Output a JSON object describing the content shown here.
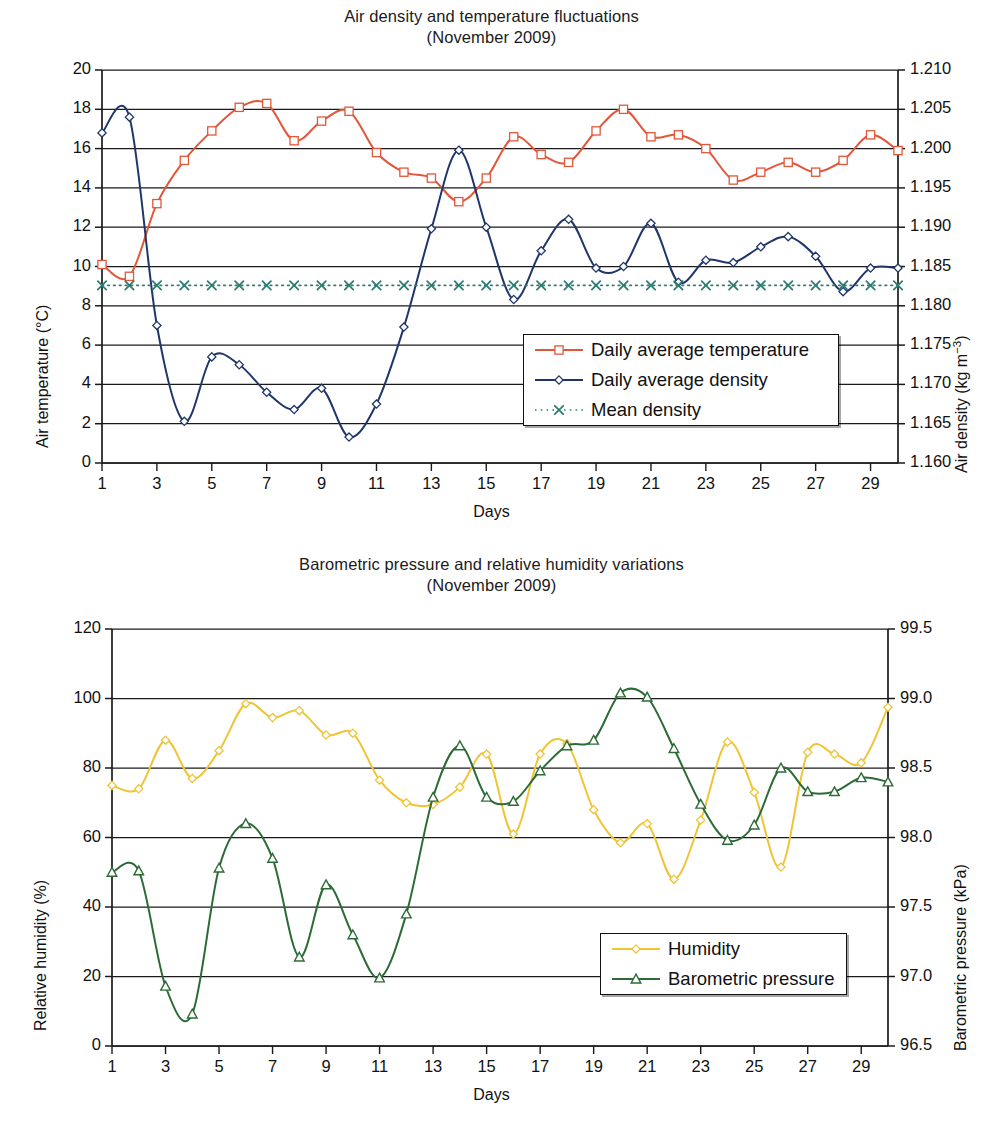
{
  "chart_data": [
    {
      "type": "line",
      "title": "Air density and temperature fluctuations",
      "subtitle": "(November 2009)",
      "xlabel": "Days",
      "ylabel": "Air temperature (°C)",
      "y2label": "Air density (kg m−3)",
      "xlim": [
        1,
        30
      ],
      "ylim": [
        0,
        20
      ],
      "y2lim": [
        1.16,
        1.21
      ],
      "grid": true,
      "legend_position": "inside-lower-right",
      "xticks": [
        1,
        3,
        5,
        7,
        9,
        11,
        13,
        15,
        17,
        19,
        21,
        23,
        25,
        27,
        29
      ],
      "yticks": [
        0,
        2,
        4,
        6,
        8,
        10,
        12,
        14,
        16,
        18,
        20
      ],
      "y2ticks": [
        "1.160",
        "1.165",
        "1.170",
        "1.175",
        "1.180",
        "1.185",
        "1.190",
        "1.195",
        "1.200",
        "1.205",
        "1.210"
      ],
      "x": [
        1,
        2,
        3,
        4,
        5,
        6,
        7,
        8,
        9,
        10,
        11,
        12,
        13,
        14,
        15,
        16,
        17,
        18,
        19,
        20,
        21,
        22,
        23,
        24,
        25,
        26,
        27,
        28,
        29,
        30
      ],
      "series": [
        {
          "name": "Daily average temperature",
          "axis": "left",
          "unit": "°C",
          "color": "#E2563A",
          "marker": "square-open",
          "values": [
            10.1,
            9.5,
            13.2,
            15.4,
            16.9,
            18.1,
            18.3,
            16.4,
            17.4,
            17.9,
            15.8,
            14.8,
            14.5,
            13.3,
            14.5,
            16.6,
            15.7,
            15.3,
            16.9,
            18.0,
            16.6,
            16.7,
            16.0,
            14.4,
            14.8,
            15.3,
            14.8,
            15.4,
            16.7,
            15.9
          ]
        },
        {
          "name": "Daily average density",
          "axis": "right",
          "unit": "kg m-3",
          "color": "#20366B",
          "marker": "diamond-open",
          "values_left_scale": [
            16.8,
            17.6,
            7.0,
            2.1,
            5.4,
            5.0,
            3.6,
            2.7,
            3.8,
            1.3,
            3.0,
            6.9,
            11.9,
            15.9,
            12.0,
            8.3,
            10.8,
            12.4,
            9.9,
            10.0,
            12.2,
            9.2,
            10.3,
            10.2,
            11.0,
            11.5,
            10.5,
            8.7,
            9.9,
            9.9
          ],
          "values": [
            1.202,
            1.204,
            1.1775,
            1.1653,
            1.1735,
            1.1725,
            1.169,
            1.1668,
            1.1695,
            1.1633,
            1.1675,
            1.1773,
            1.1898,
            1.1998,
            1.19,
            1.1808,
            1.187,
            1.191,
            1.1848,
            1.185,
            1.1905,
            1.183,
            1.1858,
            1.1855,
            1.1875,
            1.1888,
            1.1863,
            1.1818,
            1.1848,
            1.1848
          ]
        },
        {
          "name": "Mean density",
          "axis": "right",
          "unit": "kg m-3",
          "color": "#2E7D72",
          "marker": "x",
          "value_left_scale": 9.05,
          "values": [
            1.1826,
            1.1826,
            1.1826,
            1.1826,
            1.1826,
            1.1826,
            1.1826,
            1.1826,
            1.1826,
            1.1826,
            1.1826,
            1.1826,
            1.1826,
            1.1826,
            1.1826,
            1.1826,
            1.1826,
            1.1826,
            1.1826,
            1.1826,
            1.1826,
            1.1826,
            1.1826,
            1.1826,
            1.1826,
            1.1826,
            1.1826,
            1.1826,
            1.1826,
            1.1826
          ]
        }
      ]
    },
    {
      "type": "line",
      "title": "Barometric pressure and relative humidity variations",
      "subtitle": "(November 2009)",
      "xlabel": "Days",
      "ylabel": "Relative humidity (%)",
      "y2label": "Barometric pressure (kPa)",
      "xlim": [
        1,
        30
      ],
      "ylim": [
        0,
        120
      ],
      "y2lim": [
        96.5,
        99.5
      ],
      "grid": true,
      "legend_position": "inside-lower-right",
      "xticks": [
        1,
        3,
        5,
        7,
        9,
        11,
        13,
        15,
        17,
        19,
        21,
        23,
        25,
        27,
        29
      ],
      "yticks": [
        0,
        20,
        40,
        60,
        80,
        100,
        120
      ],
      "y2ticks": [
        "96.5",
        "97.0",
        "97.5",
        "98.0",
        "98.5",
        "99.0",
        "99.5"
      ],
      "x": [
        1,
        2,
        3,
        4,
        5,
        6,
        7,
        8,
        9,
        10,
        11,
        12,
        13,
        14,
        15,
        16,
        17,
        18,
        19,
        20,
        21,
        22,
        23,
        24,
        25,
        26,
        27,
        28,
        29,
        30
      ],
      "series": [
        {
          "name": "Humidity",
          "axis": "left",
          "unit": "%",
          "color": "#F0C437",
          "marker": "diamond-open",
          "values": [
            75,
            74,
            88,
            77,
            85,
            98.5,
            94.5,
            96.5,
            89.5,
            90,
            76.5,
            70,
            69.5,
            74.5,
            84,
            61,
            84,
            87,
            68,
            58.5,
            64,
            48,
            65,
            87.5,
            73,
            51.5,
            84.5,
            84,
            81.5,
            97.5
          ]
        },
        {
          "name": "Barometric pressure",
          "axis": "right",
          "unit": "kPa",
          "color": "#2D6B36",
          "marker": "triangle-open",
          "values_left_scale": [
            50,
            50.5,
            17,
            9,
            51,
            64,
            54,
            25.5,
            46.5,
            32,
            19.5,
            38,
            71.5,
            86.5,
            71.5,
            70.5,
            79,
            86.5,
            88,
            101.5,
            100.5,
            85.5,
            69.5,
            59,
            63.5,
            80,
            73,
            73,
            77,
            76
          ],
          "values": [
            97.75,
            97.76,
            96.93,
            96.73,
            97.78,
            98.1,
            97.85,
            97.14,
            97.66,
            97.3,
            96.99,
            97.45,
            98.29,
            98.66,
            98.29,
            98.26,
            98.48,
            98.66,
            98.7,
            99.04,
            99.01,
            98.64,
            98.24,
            97.98,
            98.09,
            98.5,
            98.33,
            98.33,
            98.43,
            98.4
          ]
        }
      ]
    }
  ],
  "top_chart": {
    "title_line1": "Air density and temperature fluctuations",
    "title_line2": "(November 2009)",
    "y_left_label": "Air temperature (°C)",
    "y_right_label_main": "Air density (kg m",
    "y_right_label_sup": "−3",
    "y_right_label_tail": ")",
    "x_label": "Days",
    "legend": [
      {
        "label": "Daily average temperature"
      },
      {
        "label": "Daily average density"
      },
      {
        "label": "Mean density"
      }
    ]
  },
  "bottom_chart": {
    "title_line1": "Barometric pressure and relative humidity variations",
    "title_line2": "(November 2009)",
    "y_left_label": "Relative humidity (%)",
    "y_right_label": "Barometric pressure (kPa)",
    "x_label": "Days",
    "legend": [
      {
        "label": "Humidity"
      },
      {
        "label": "Barometric pressure"
      }
    ]
  },
  "colors": {
    "temperature": "#E2563A",
    "density": "#20366B",
    "mean_density": "#2E7D72",
    "humidity": "#F0C437",
    "pressure": "#2D6B36",
    "axis": "#1a1a1a"
  }
}
